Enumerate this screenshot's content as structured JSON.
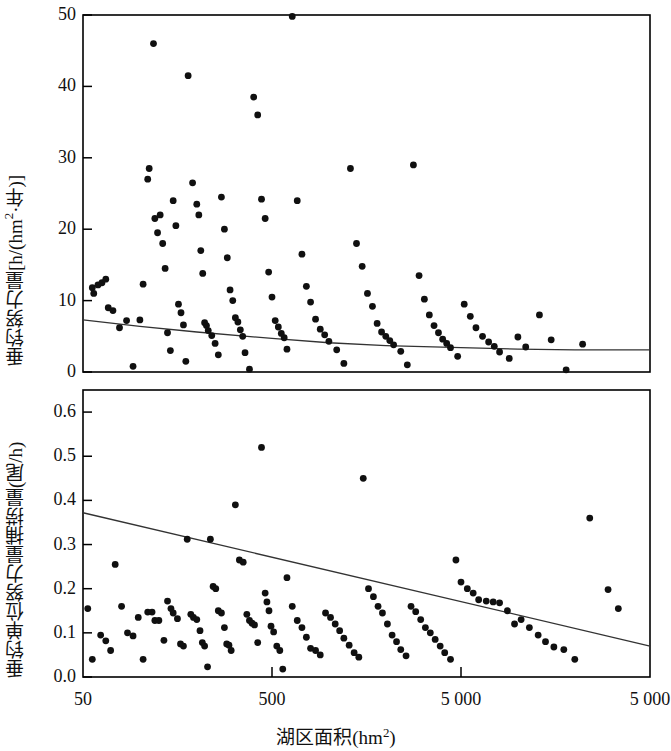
{
  "figure": {
    "x_axis": {
      "title_prefix": "湖区面积(hm",
      "title_sup": "2",
      "title_suffix": ")",
      "scale": "log",
      "ticks": [
        {
          "value": 50,
          "label": "50"
        },
        {
          "value": 500,
          "label": "500"
        },
        {
          "value": 5000,
          "label": "5 000"
        },
        {
          "value": 50000,
          "label": "5 000"
        }
      ],
      "range": [
        50,
        50000
      ]
    },
    "panels": [
      {
        "id": "top",
        "y_axis": {
          "title_prefix": "垂钓努力量[h/(hm",
          "title_sup": "2",
          "title_suffix": "·年)]",
          "ticks": [
            "0",
            "10",
            "20",
            "30",
            "40",
            "50"
          ],
          "range": [
            0,
            50
          ]
        }
      },
      {
        "id": "bottom",
        "y_axis": {
          "title": "垂钓单位努力量捕捞量(尾/h)",
          "ticks": [
            "0.0",
            "0.1",
            "0.2",
            "0.3",
            "0.4",
            "0.5",
            "0.6"
          ],
          "range": [
            0.0,
            0.65
          ]
        }
      }
    ],
    "style": {
      "marker_color": "#101010",
      "line_color": "#333333",
      "axis_color": "#000000",
      "background": "#ffffff",
      "marker_radius": 3.4,
      "line_width": 1.3
    }
  },
  "chart_data": [
    {
      "type": "scatter",
      "panel": "top",
      "title": "",
      "xlabel": "湖区面积(hm2)",
      "ylabel": "垂钓努力量[h/(hm2·年)]",
      "xscale": "log",
      "xlim": [
        50,
        50000
      ],
      "ylim": [
        0,
        50
      ],
      "xticks": [
        50,
        500,
        5000,
        50000
      ],
      "xticklabels": [
        "50",
        "500",
        "5 000",
        "5 000"
      ],
      "yticks": [
        0,
        10,
        20,
        30,
        40,
        50
      ],
      "grid": false,
      "legend": "none",
      "series": [
        {
          "name": "垂钓努力量",
          "marker": "filled-circle",
          "points": [
            [
              56,
              11.8
            ],
            [
              57,
              11.0
            ],
            [
              60,
              12.2
            ],
            [
              63,
              12.5
            ],
            [
              66,
              13.0
            ],
            [
              68,
              9.0
            ],
            [
              72,
              8.6
            ],
            [
              78,
              6.2
            ],
            [
              85,
              7.2
            ],
            [
              92,
              0.8
            ],
            [
              100,
              7.3
            ],
            [
              104,
              12.3
            ],
            [
              110,
              27.0
            ],
            [
              112,
              28.5
            ],
            [
              118,
              46.0
            ],
            [
              120,
              21.5
            ],
            [
              124,
              19.5
            ],
            [
              128,
              22.0
            ],
            [
              132,
              18.0
            ],
            [
              136,
              14.5
            ],
            [
              140,
              5.5
            ],
            [
              145,
              3.0
            ],
            [
              150,
              24.0
            ],
            [
              155,
              20.5
            ],
            [
              160,
              9.5
            ],
            [
              165,
              8.3
            ],
            [
              170,
              6.6
            ],
            [
              175,
              1.5
            ],
            [
              180,
              41.5
            ],
            [
              190,
              26.5
            ],
            [
              200,
              23.5
            ],
            [
              205,
              22.0
            ],
            [
              210,
              17.0
            ],
            [
              215,
              13.8
            ],
            [
              220,
              6.9
            ],
            [
              225,
              6.5
            ],
            [
              230,
              5.8
            ],
            [
              240,
              5.1
            ],
            [
              250,
              4.0
            ],
            [
              260,
              2.4
            ],
            [
              270,
              24.5
            ],
            [
              280,
              20.0
            ],
            [
              290,
              16.0
            ],
            [
              300,
              11.5
            ],
            [
              310,
              10.0
            ],
            [
              320,
              7.6
            ],
            [
              330,
              7.0
            ],
            [
              340,
              5.9
            ],
            [
              350,
              5.0
            ],
            [
              360,
              2.7
            ],
            [
              380,
              0.4
            ],
            [
              400,
              38.5
            ],
            [
              420,
              36.0
            ],
            [
              440,
              24.2
            ],
            [
              460,
              21.5
            ],
            [
              480,
              14.0
            ],
            [
              500,
              10.5
            ],
            [
              520,
              7.2
            ],
            [
              540,
              6.3
            ],
            [
              560,
              5.4
            ],
            [
              580,
              4.8
            ],
            [
              600,
              3.2
            ],
            [
              640,
              49.8
            ],
            [
              680,
              24.0
            ],
            [
              720,
              16.5
            ],
            [
              760,
              12.0
            ],
            [
              800,
              9.8
            ],
            [
              850,
              7.4
            ],
            [
              900,
              6.0
            ],
            [
              950,
              5.2
            ],
            [
              1000,
              4.3
            ],
            [
              1100,
              3.1
            ],
            [
              1200,
              1.2
            ],
            [
              1300,
              28.5
            ],
            [
              1400,
              18.0
            ],
            [
              1500,
              14.8
            ],
            [
              1600,
              11.0
            ],
            [
              1700,
              9.2
            ],
            [
              1800,
              6.8
            ],
            [
              1900,
              5.6
            ],
            [
              2000,
              5.0
            ],
            [
              2100,
              4.4
            ],
            [
              2200,
              3.8
            ],
            [
              2400,
              2.9
            ],
            [
              2600,
              1.0
            ],
            [
              2800,
              29.0
            ],
            [
              3000,
              13.5
            ],
            [
              3200,
              10.2
            ],
            [
              3400,
              8.0
            ],
            [
              3600,
              6.5
            ],
            [
              3800,
              5.5
            ],
            [
              4000,
              4.6
            ],
            [
              4200,
              4.0
            ],
            [
              4400,
              3.4
            ],
            [
              4800,
              2.2
            ],
            [
              5200,
              9.5
            ],
            [
              5600,
              7.8
            ],
            [
              6000,
              6.2
            ],
            [
              6500,
              5.0
            ],
            [
              7000,
              4.2
            ],
            [
              7500,
              3.6
            ],
            [
              8000,
              2.8
            ],
            [
              9000,
              1.9
            ],
            [
              10000,
              4.9
            ],
            [
              11000,
              3.5
            ],
            [
              13000,
              8.0
            ],
            [
              15000,
              4.5
            ],
            [
              18000,
              0.3
            ],
            [
              22000,
              3.9
            ]
          ]
        }
      ],
      "fit_line": {
        "name": "拟合曲线",
        "type": "power-decay",
        "points": [
          [
            50,
            7.3
          ],
          [
            100,
            6.4
          ],
          [
            200,
            5.6
          ],
          [
            500,
            4.7
          ],
          [
            1000,
            4.1
          ],
          [
            2000,
            3.7
          ],
          [
            5000,
            3.4
          ],
          [
            10000,
            3.2
          ],
          [
            20000,
            3.1
          ],
          [
            50000,
            3.1
          ]
        ]
      }
    },
    {
      "type": "scatter",
      "panel": "bottom",
      "title": "",
      "xlabel": "湖区面积(hm2)",
      "ylabel": "垂钓单位努力量捕捞量(尾/h)",
      "xscale": "log",
      "xlim": [
        50,
        50000
      ],
      "ylim": [
        0.0,
        0.65
      ],
      "xticks": [
        50,
        500,
        5000,
        50000
      ],
      "xticklabels": [
        "50",
        "500",
        "5 000",
        "5 000"
      ],
      "yticks": [
        0.0,
        0.1,
        0.2,
        0.3,
        0.4,
        0.5,
        0.6
      ],
      "grid": false,
      "legend": "none",
      "series": [
        {
          "name": "垂钓单位努力量捕捞量",
          "marker": "filled-circle",
          "points": [
            [
              53,
              0.155
            ],
            [
              56,
              0.04
            ],
            [
              62,
              0.095
            ],
            [
              66,
              0.082
            ],
            [
              70,
              0.06
            ],
            [
              74,
              0.255
            ],
            [
              80,
              0.16
            ],
            [
              86,
              0.1
            ],
            [
              92,
              0.093
            ],
            [
              98,
              0.135
            ],
            [
              104,
              0.04
            ],
            [
              110,
              0.147
            ],
            [
              116,
              0.147
            ],
            [
              120,
              0.128
            ],
            [
              126,
              0.128
            ],
            [
              134,
              0.083
            ],
            [
              140,
              0.172
            ],
            [
              146,
              0.155
            ],
            [
              150,
              0.145
            ],
            [
              158,
              0.132
            ],
            [
              164,
              0.075
            ],
            [
              170,
              0.07
            ],
            [
              178,
              0.312
            ],
            [
              186,
              0.142
            ],
            [
              192,
              0.135
            ],
            [
              200,
              0.13
            ],
            [
              208,
              0.105
            ],
            [
              214,
              0.078
            ],
            [
              220,
              0.07
            ],
            [
              228,
              0.023
            ],
            [
              236,
              0.312
            ],
            [
              244,
              0.205
            ],
            [
              252,
              0.2
            ],
            [
              260,
              0.15
            ],
            [
              270,
              0.145
            ],
            [
              280,
              0.112
            ],
            [
              288,
              0.075
            ],
            [
              296,
              0.072
            ],
            [
              304,
              0.06
            ],
            [
              320,
              0.39
            ],
            [
              336,
              0.265
            ],
            [
              352,
              0.26
            ],
            [
              368,
              0.142
            ],
            [
              380,
              0.128
            ],
            [
              392,
              0.122
            ],
            [
              404,
              0.118
            ],
            [
              420,
              0.078
            ],
            [
              440,
              0.52
            ],
            [
              460,
              0.19
            ],
            [
              470,
              0.17
            ],
            [
              482,
              0.15
            ],
            [
              494,
              0.115
            ],
            [
              510,
              0.102
            ],
            [
              530,
              0.07
            ],
            [
              550,
              0.06
            ],
            [
              570,
              0.018
            ],
            [
              600,
              0.225
            ],
            [
              640,
              0.16
            ],
            [
              680,
              0.128
            ],
            [
              720,
              0.112
            ],
            [
              760,
              0.09
            ],
            [
              800,
              0.065
            ],
            [
              850,
              0.06
            ],
            [
              900,
              0.05
            ],
            [
              960,
              0.145
            ],
            [
              1020,
              0.135
            ],
            [
              1080,
              0.12
            ],
            [
              1140,
              0.105
            ],
            [
              1200,
              0.088
            ],
            [
              1280,
              0.072
            ],
            [
              1360,
              0.055
            ],
            [
              1440,
              0.045
            ],
            [
              1520,
              0.45
            ],
            [
              1620,
              0.2
            ],
            [
              1720,
              0.182
            ],
            [
              1820,
              0.16
            ],
            [
              1920,
              0.145
            ],
            [
              2040,
              0.12
            ],
            [
              2160,
              0.095
            ],
            [
              2280,
              0.08
            ],
            [
              2400,
              0.062
            ],
            [
              2560,
              0.048
            ],
            [
              2720,
              0.16
            ],
            [
              2880,
              0.148
            ],
            [
              3060,
              0.13
            ],
            [
              3240,
              0.112
            ],
            [
              3440,
              0.1
            ],
            [
              3650,
              0.085
            ],
            [
              3880,
              0.07
            ],
            [
              4100,
              0.055
            ],
            [
              4400,
              0.04
            ],
            [
              4700,
              0.265
            ],
            [
              5000,
              0.215
            ],
            [
              5400,
              0.2
            ],
            [
              5800,
              0.19
            ],
            [
              6200,
              0.175
            ],
            [
              6800,
              0.172
            ],
            [
              7400,
              0.17
            ],
            [
              8000,
              0.168
            ],
            [
              8800,
              0.15
            ],
            [
              9600,
              0.12
            ],
            [
              10400,
              0.13
            ],
            [
              11500,
              0.112
            ],
            [
              12800,
              0.095
            ],
            [
              14000,
              0.08
            ],
            [
              15500,
              0.068
            ],
            [
              17500,
              0.062
            ],
            [
              20000,
              0.04
            ],
            [
              24000,
              0.36
            ],
            [
              30000,
              0.198
            ],
            [
              34000,
              0.155
            ]
          ]
        }
      ],
      "fit_line": {
        "name": "拟合直线",
        "type": "linear-on-log",
        "points": [
          [
            50,
            0.372
          ],
          [
            50000,
            0.07
          ]
        ]
      }
    }
  ]
}
